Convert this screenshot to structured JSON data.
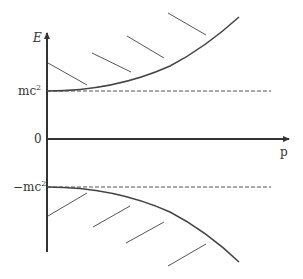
{
  "diagram": {
    "labels": {
      "y_axis": "E",
      "x_axis": "p",
      "upper_level": "mc",
      "upper_level_sup": "2",
      "zero": "0",
      "lower_level": "−mc",
      "lower_level_sup": "2"
    },
    "colors": {
      "axis": "#333333",
      "curve": "#444444",
      "hatch": "#555555",
      "dashed": "#555555",
      "background": "#ffffff"
    },
    "branches": [
      {
        "name": "positive-energy",
        "equation": "E = +sqrt(p^2c^2 + m^2c^4)",
        "hatched": "above"
      },
      {
        "name": "negative-energy",
        "equation": "E = -sqrt(p^2c^2 + m^2c^4)",
        "hatched": "below"
      }
    ]
  }
}
